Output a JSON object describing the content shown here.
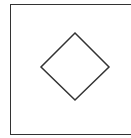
{
  "diagram": {
    "shapes": [
      {
        "type": "rectangle",
        "role": "frame",
        "stroke": "#333333"
      },
      {
        "type": "diamond",
        "stroke": "#333333",
        "points": [
          [
            75,
            33
          ],
          [
            109,
            67
          ],
          [
            75,
            100
          ],
          [
            41,
            67
          ]
        ]
      }
    ]
  }
}
